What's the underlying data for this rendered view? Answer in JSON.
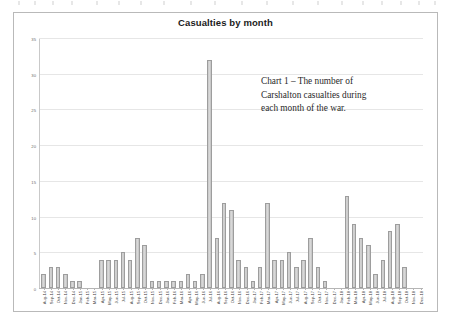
{
  "panel": {
    "title": "Casualties by month"
  },
  "annotation": {
    "line1": "Chart 1 – The number of",
    "line2": "Carshalton casualties during",
    "line3": "each month of the war."
  },
  "chart_data": {
    "type": "bar",
    "title": "Casualties by month",
    "xlabel": "",
    "ylabel": "",
    "ylim": [
      0,
      35
    ],
    "ytick_step": 5,
    "grid": true,
    "legend": false,
    "bar_color": "#cccccc",
    "bar_border_color": "#9d9d9d",
    "yticks": [
      "0",
      "5",
      "10",
      "15",
      "20",
      "25",
      "30",
      "35"
    ],
    "categories": [
      "Aug-14",
      "Sep-14",
      "Oct-14",
      "Nov-14",
      "Dec-14",
      "Jan-15",
      "Feb-15",
      "Mar-15",
      "Apr-15",
      "May-15",
      "Jun-15",
      "Jul-15",
      "Aug-15",
      "Sep-15",
      "Oct-15",
      "Nov-15",
      "Dec-15",
      "Jan-16",
      "Feb-16",
      "Mar-16",
      "Apr-16",
      "May-16",
      "Jun-16",
      "Jul-16",
      "Aug-16",
      "Sep-16",
      "Oct-16",
      "Nov-16",
      "Dec-16",
      "Jan-17",
      "Feb-17",
      "Mar-17",
      "Apr-17",
      "May-17",
      "Jun-17",
      "Jul-17",
      "Aug-17",
      "Sep-17",
      "Oct-17",
      "Nov-17",
      "Dec-17",
      "Jan-18",
      "Feb-18",
      "Mar-18",
      "Apr-18",
      "May-18",
      "Jun-18",
      "Jul-18",
      "Aug-18",
      "Sep-18",
      "Oct-18",
      "Nov-18",
      "Dec-18"
    ],
    "values": [
      2,
      3,
      3,
      2,
      1,
      1,
      0,
      0,
      4,
      4,
      4,
      5,
      4,
      7,
      6,
      1,
      1,
      1,
      1,
      1,
      2,
      1,
      2,
      32,
      7,
      12,
      11,
      4,
      3,
      1,
      3,
      12,
      4,
      4,
      5,
      3,
      4,
      7,
      3,
      1,
      0,
      0,
      13,
      9,
      7,
      6,
      2,
      4,
      8,
      9,
      3,
      0,
      0
    ],
    "annotation": "Chart 1 – The number of Carshalton casualties during each month of the war."
  }
}
